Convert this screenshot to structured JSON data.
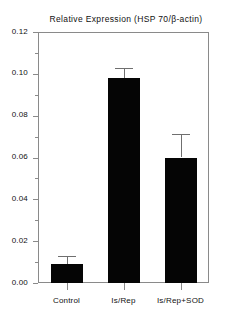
{
  "chart_data": {
    "type": "bar",
    "title": "Relative Expression (HSP 70/β-actin)",
    "xlabel": "",
    "ylabel": "",
    "categories": [
      "Control",
      "Is/Rep",
      "Is/Rep+SOD"
    ],
    "values": [
      0.009,
      0.098,
      0.06
    ],
    "errors": [
      0.004,
      0.005,
      0.011
    ],
    "error_tops": [
      0.013,
      0.103,
      0.071
    ],
    "ylim": [
      0.0,
      0.12
    ],
    "ytick_labels": [
      "0.00",
      "0.02",
      "0.04",
      "0.06",
      "0.08",
      "0.10",
      "0.12"
    ],
    "ytick_values": [
      0.0,
      0.02,
      0.04,
      0.06,
      0.08,
      0.1,
      0.12
    ],
    "yminor_values": [
      0.01,
      0.03,
      0.05,
      0.07,
      0.09,
      0.11
    ],
    "grid": false,
    "legend": "none",
    "bar_color": "#050505",
    "error_color": "#6f6f6f",
    "axis_color": "#8a8a8a",
    "background": "#ffffff"
  }
}
